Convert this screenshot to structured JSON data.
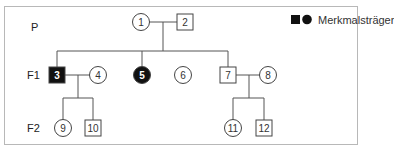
{
  "generations": [
    {
      "id": "P",
      "label": "P",
      "y": 22
    },
    {
      "id": "F1",
      "label": "F1",
      "y": 75
    },
    {
      "id": "F2",
      "label": "F2",
      "y": 128
    }
  ],
  "legend": {
    "label": "Merkmalsträger",
    "symbols": [
      "filled-square",
      "filled-circle"
    ]
  },
  "individuals": [
    {
      "id": "1",
      "label": "1",
      "sex": "female",
      "affected": false,
      "x": 141,
      "y": 22
    },
    {
      "id": "2",
      "label": "2",
      "sex": "male",
      "affected": false,
      "x": 185,
      "y": 22
    },
    {
      "id": "3",
      "label": "3",
      "sex": "male",
      "affected": true,
      "x": 57,
      "y": 75
    },
    {
      "id": "4",
      "label": "4",
      "sex": "female",
      "affected": false,
      "x": 98,
      "y": 75
    },
    {
      "id": "5",
      "label": "5",
      "sex": "female",
      "affected": true,
      "x": 142,
      "y": 75
    },
    {
      "id": "6",
      "label": "6",
      "sex": "female",
      "affected": false,
      "x": 183,
      "y": 75
    },
    {
      "id": "7",
      "label": "7",
      "sex": "male",
      "affected": false,
      "x": 228,
      "y": 75
    },
    {
      "id": "8",
      "label": "8",
      "sex": "female",
      "affected": false,
      "x": 268,
      "y": 75
    },
    {
      "id": "9",
      "label": "9",
      "sex": "female",
      "affected": false,
      "x": 63,
      "y": 128
    },
    {
      "id": "10",
      "label": "10",
      "sex": "male",
      "affected": false,
      "x": 93,
      "y": 128
    },
    {
      "id": "11",
      "label": "11",
      "sex": "female",
      "affected": false,
      "x": 233,
      "y": 128
    },
    {
      "id": "12",
      "label": "12",
      "sex": "male",
      "affected": false,
      "x": 264,
      "y": 128
    }
  ],
  "colors": {
    "line": "#555555",
    "affected": "#111111",
    "border": "#b8b8b8"
  }
}
